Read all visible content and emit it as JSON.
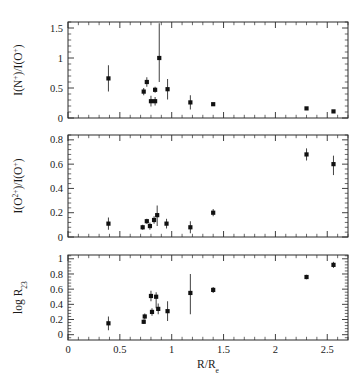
{
  "figure": {
    "background_color": "#ffffff",
    "marker_color": "#111111",
    "error_bar_color": "#4a4a4a",
    "axis_color": "#2b2b2b",
    "xlabel": "R/R",
    "xlabel_sub": "e",
    "xlim": [
      0,
      2.7
    ],
    "xticks": [
      0,
      0.5,
      1,
      1.5,
      2,
      2.5
    ],
    "xticklabels": [
      "0",
      "0.5",
      "1",
      "1.5",
      "2",
      "2.5"
    ]
  },
  "chart_data": [
    {
      "type": "scatter",
      "panel": "top",
      "title": "",
      "xlabel": "",
      "ylabel": "I(N+)/I(O+)",
      "ylabel_parts": [
        "I(N",
        "+",
        ")/I(O",
        "+",
        ")"
      ],
      "xlim": [
        0,
        2.7
      ],
      "ylim": [
        0,
        1.6
      ],
      "yticks": [
        0,
        0.5,
        1,
        1.5
      ],
      "yticklabels": [
        "0",
        "0.5",
        "1",
        "1.5"
      ],
      "grid": false,
      "legend": "none",
      "points": [
        {
          "x": 0.39,
          "y": 0.66,
          "yerr_lo": 0.22,
          "yerr_hi": 0.22
        },
        {
          "x": 0.73,
          "y": 0.44,
          "yerr_lo": 0.06,
          "yerr_hi": 0.06
        },
        {
          "x": 0.76,
          "y": 0.6,
          "yerr_lo": 0.08,
          "yerr_hi": 0.08
        },
        {
          "x": 0.8,
          "y": 0.28,
          "yerr_lo": 0.09,
          "yerr_hi": 0.09
        },
        {
          "x": 0.84,
          "y": 0.28,
          "yerr_lo": 0.07,
          "yerr_hi": 0.07
        },
        {
          "x": 0.84,
          "y": 0.47,
          "yerr_lo": 0.05,
          "yerr_hi": 0.05
        },
        {
          "x": 0.88,
          "y": 1.0,
          "yerr_lo": 0.4,
          "yerr_hi": 0.58
        },
        {
          "x": 0.96,
          "y": 0.48,
          "yerr_lo": 0.17,
          "yerr_hi": 0.17
        },
        {
          "x": 1.18,
          "y": 0.26,
          "yerr_lo": 0.12,
          "yerr_hi": 0.12
        },
        {
          "x": 1.4,
          "y": 0.23,
          "yerr_lo": 0.02,
          "yerr_hi": 0.02
        },
        {
          "x": 2.3,
          "y": 0.16,
          "yerr_lo": 0.01,
          "yerr_hi": 0.01
        },
        {
          "x": 2.56,
          "y": 0.11,
          "yerr_lo": 0.01,
          "yerr_hi": 0.01
        }
      ]
    },
    {
      "type": "scatter",
      "panel": "middle",
      "title": "",
      "xlabel": "",
      "ylabel": "I(O2+)/I(O+)",
      "ylabel_parts": [
        "I(O",
        "2+",
        ")/I(O",
        "+",
        ")"
      ],
      "xlim": [
        0,
        2.7
      ],
      "ylim": [
        0,
        0.84
      ],
      "yticks": [
        0,
        0.2,
        0.4,
        0.6,
        0.8
      ],
      "yticklabels": [
        "0",
        "0.2",
        "0.4",
        "0.6",
        "0.8"
      ],
      "grid": false,
      "legend": "none",
      "points": [
        {
          "x": 0.39,
          "y": 0.11,
          "yerr_lo": 0.05,
          "yerr_hi": 0.05
        },
        {
          "x": 0.72,
          "y": 0.08,
          "yerr_lo": 0.02,
          "yerr_hi": 0.02
        },
        {
          "x": 0.76,
          "y": 0.13,
          "yerr_lo": 0.02,
          "yerr_hi": 0.02
        },
        {
          "x": 0.79,
          "y": 0.09,
          "yerr_lo": 0.03,
          "yerr_hi": 0.03
        },
        {
          "x": 0.83,
          "y": 0.14,
          "yerr_lo": 0.03,
          "yerr_hi": 0.03
        },
        {
          "x": 0.86,
          "y": 0.18,
          "yerr_lo": 0.09,
          "yerr_hi": 0.08
        },
        {
          "x": 0.95,
          "y": 0.11,
          "yerr_lo": 0.04,
          "yerr_hi": 0.04
        },
        {
          "x": 1.18,
          "y": 0.08,
          "yerr_lo": 0.05,
          "yerr_hi": 0.05
        },
        {
          "x": 1.4,
          "y": 0.2,
          "yerr_lo": 0.03,
          "yerr_hi": 0.03
        },
        {
          "x": 2.3,
          "y": 0.68,
          "yerr_lo": 0.05,
          "yerr_hi": 0.05
        },
        {
          "x": 2.56,
          "y": 0.6,
          "yerr_lo": 0.09,
          "yerr_hi": 0.07
        }
      ]
    },
    {
      "type": "scatter",
      "panel": "bottom",
      "title": "",
      "xlabel": "R/Re",
      "ylabel": "log R23",
      "ylabel_parts": [
        "log R",
        "23"
      ],
      "xlim": [
        0,
        2.7
      ],
      "ylim": [
        -0.07,
        1.05
      ],
      "yticks": [
        0,
        0.2,
        0.4,
        0.6,
        0.8,
        1
      ],
      "yticklabels": [
        "0",
        "0.2",
        "0.4",
        "0.6",
        "0.8",
        "1"
      ],
      "grid": false,
      "legend": "none",
      "points": [
        {
          "x": 0.39,
          "y": 0.15,
          "yerr_lo": 0.09,
          "yerr_hi": 0.09
        },
        {
          "x": 0.73,
          "y": 0.17,
          "yerr_lo": 0.03,
          "yerr_hi": 0.03
        },
        {
          "x": 0.74,
          "y": 0.24,
          "yerr_lo": 0.04,
          "yerr_hi": 0.04
        },
        {
          "x": 0.8,
          "y": 0.51,
          "yerr_lo": 0.07,
          "yerr_hi": 0.07
        },
        {
          "x": 0.81,
          "y": 0.3,
          "yerr_lo": 0.05,
          "yerr_hi": 0.05
        },
        {
          "x": 0.85,
          "y": 0.5,
          "yerr_lo": 0.15,
          "yerr_hi": 0.06
        },
        {
          "x": 0.87,
          "y": 0.34,
          "yerr_lo": 0.07,
          "yerr_hi": 0.07
        },
        {
          "x": 0.96,
          "y": 0.31,
          "yerr_lo": 0.13,
          "yerr_hi": 0.13
        },
        {
          "x": 1.18,
          "y": 0.55,
          "yerr_lo": 0.28,
          "yerr_hi": 0.25
        },
        {
          "x": 1.4,
          "y": 0.59,
          "yerr_lo": 0.04,
          "yerr_hi": 0.04
        },
        {
          "x": 2.3,
          "y": 0.76,
          "yerr_lo": 0.03,
          "yerr_hi": 0.03
        },
        {
          "x": 2.56,
          "y": 0.92,
          "yerr_lo": 0.04,
          "yerr_hi": 0.04
        }
      ]
    }
  ]
}
